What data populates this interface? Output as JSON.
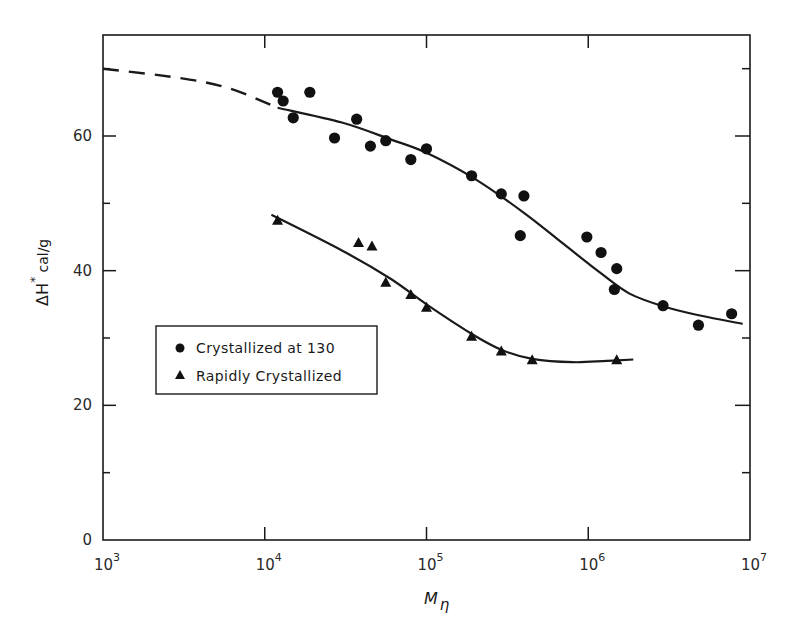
{
  "chart_data": {
    "type": "scatter",
    "title": "",
    "xlabel": "M_η",
    "xlabel_main": "M",
    "xlabel_sub": "η",
    "ylabel": "ΔH* cal/g",
    "ylabel_main": "ΔH",
    "ylabel_sup": "*",
    "ylabel_unit": "cal/g",
    "xscale": "log",
    "xlim": [
      1000,
      10000000
    ],
    "ylim": [
      0,
      75
    ],
    "x_ticks": [
      {
        "base": "10",
        "exp": "3",
        "value": 1000
      },
      {
        "base": "10",
        "exp": "4",
        "value": 10000
      },
      {
        "base": "10",
        "exp": "5",
        "value": 100000
      },
      {
        "base": "10",
        "exp": "6",
        "value": 1000000
      },
      {
        "base": "10",
        "exp": "7",
        "value": 10000000
      }
    ],
    "y_ticks_labeled": [
      {
        "label": "0",
        "value": 0
      },
      {
        "label": "20",
        "value": 20
      },
      {
        "label": "40",
        "value": 40
      },
      {
        "label": "60",
        "value": 60
      }
    ],
    "y_ticks_minor": [
      10,
      30,
      50,
      70
    ],
    "grid": false,
    "legend_position": "left-middle inside plot",
    "legend": [
      {
        "label": "Crystallized at 130",
        "marker": "circle"
      },
      {
        "label": "Rapidly Crystallized",
        "marker": "triangle"
      }
    ],
    "series": [
      {
        "name": "Crystallized at 130",
        "marker": "circle",
        "points": [
          {
            "x": 12000,
            "y": 66.5
          },
          {
            "x": 13000,
            "y": 65.2
          },
          {
            "x": 15000,
            "y": 62.7
          },
          {
            "x": 19000,
            "y": 66.5
          },
          {
            "x": 27000,
            "y": 59.7
          },
          {
            "x": 37000,
            "y": 62.5
          },
          {
            "x": 45000,
            "y": 58.5
          },
          {
            "x": 56000,
            "y": 59.3
          },
          {
            "x": 80000,
            "y": 56.5
          },
          {
            "x": 100000,
            "y": 58.1
          },
          {
            "x": 190000,
            "y": 54.1
          },
          {
            "x": 290000,
            "y": 51.4
          },
          {
            "x": 400000,
            "y": 51.1
          },
          {
            "x": 380000,
            "y": 45.2
          },
          {
            "x": 980000,
            "y": 45.0
          },
          {
            "x": 1200000,
            "y": 42.7
          },
          {
            "x": 1500000,
            "y": 40.3
          },
          {
            "x": 1450000,
            "y": 37.2
          },
          {
            "x": 2900000,
            "y": 34.8
          },
          {
            "x": 4800000,
            "y": 31.9
          },
          {
            "x": 7700000,
            "y": 33.6
          }
        ],
        "fit_curve": {
          "style": "solid",
          "points": [
            {
              "x": 12000,
              "y": 64.2
            },
            {
              "x": 30000,
              "y": 62.0
            },
            {
              "x": 60000,
              "y": 59.5
            },
            {
              "x": 100000,
              "y": 57.5
            },
            {
              "x": 200000,
              "y": 53.6
            },
            {
              "x": 400000,
              "y": 48.6
            },
            {
              "x": 700000,
              "y": 44.0
            },
            {
              "x": 1200000,
              "y": 39.6
            },
            {
              "x": 1800000,
              "y": 36.6
            },
            {
              "x": 3000000,
              "y": 34.6
            },
            {
              "x": 5000000,
              "y": 33.3
            },
            {
              "x": 9000000,
              "y": 32.1
            }
          ]
        },
        "extrapolation": {
          "style": "dashed",
          "points": [
            {
              "x": 1000,
              "y": 70.0
            },
            {
              "x": 3000,
              "y": 68.6
            },
            {
              "x": 6000,
              "y": 67.1
            },
            {
              "x": 12000,
              "y": 64.2
            }
          ]
        }
      },
      {
        "name": "Rapidly Crystallized",
        "marker": "triangle",
        "points": [
          {
            "x": 12000,
            "y": 47.4
          },
          {
            "x": 38000,
            "y": 44.1
          },
          {
            "x": 46000,
            "y": 43.6
          },
          {
            "x": 56000,
            "y": 38.2
          },
          {
            "x": 80000,
            "y": 36.4
          },
          {
            "x": 100000,
            "y": 34.5
          },
          {
            "x": 190000,
            "y": 30.2
          },
          {
            "x": 290000,
            "y": 28.0
          },
          {
            "x": 450000,
            "y": 26.7
          },
          {
            "x": 1500000,
            "y": 26.7
          }
        ],
        "fit_curve": {
          "style": "solid",
          "points": [
            {
              "x": 11000,
              "y": 48.3
            },
            {
              "x": 30000,
              "y": 43.0
            },
            {
              "x": 60000,
              "y": 38.8
            },
            {
              "x": 100000,
              "y": 35.0
            },
            {
              "x": 200000,
              "y": 30.3
            },
            {
              "x": 300000,
              "y": 28.1
            },
            {
              "x": 450000,
              "y": 26.9
            },
            {
              "x": 800000,
              "y": 26.4
            },
            {
              "x": 1300000,
              "y": 26.6
            },
            {
              "x": 1900000,
              "y": 26.8
            }
          ]
        }
      }
    ]
  }
}
